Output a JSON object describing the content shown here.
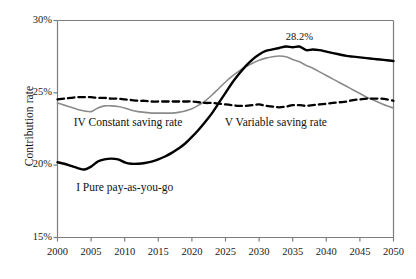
{
  "chart_data": {
    "type": "line",
    "title": "",
    "xlabel": "",
    "ylabel": "Contribution rate",
    "xlim": [
      2000,
      2050
    ],
    "ylim": [
      15,
      30
    ],
    "xticks": [
      2000,
      2005,
      2010,
      2015,
      2020,
      2025,
      2030,
      2035,
      2040,
      2045,
      2050
    ],
    "xtick_labels": [
      "2000",
      "2005",
      "2010",
      "2015",
      "2020",
      "2025",
      "2030",
      "2035",
      "2040",
      "2045",
      "2050"
    ],
    "yticks": [
      15,
      20,
      25,
      30
    ],
    "ytick_labels": [
      "15%",
      "20%",
      "25%",
      "30%"
    ],
    "grid": false,
    "legend_position": "inline-annotations",
    "annotations": [
      {
        "text": "28.2%",
        "x": 2036,
        "y": 28.2,
        "name": "peak-value-label"
      },
      {
        "text": "I Pure pay-as-you-go",
        "x": 2010,
        "y": 18.5,
        "name": "series-label-pay-as-you-go"
      },
      {
        "text": "IV Constant saving rate",
        "x": 2010.5,
        "y": 23.0,
        "name": "series-label-constant-saving"
      },
      {
        "text": "V Variable saving rate",
        "x": 2032.5,
        "y": 23.0,
        "name": "series-label-variable-saving"
      }
    ],
    "x": [
      2000,
      2001,
      2002,
      2003,
      2004,
      2005,
      2006,
      2007,
      2008,
      2009,
      2010,
      2011,
      2012,
      2013,
      2014,
      2015,
      2016,
      2017,
      2018,
      2019,
      2020,
      2021,
      2022,
      2023,
      2024,
      2025,
      2026,
      2027,
      2028,
      2029,
      2030,
      2031,
      2032,
      2033,
      2034,
      2035,
      2036,
      2037,
      2038,
      2039,
      2040,
      2041,
      2042,
      2043,
      2044,
      2045,
      2046,
      2047,
      2048,
      2049,
      2050
    ],
    "series": [
      {
        "name": "I Pure pay-as-you-go",
        "style": "solid",
        "color": "#000000",
        "width": 2.4,
        "values": [
          20.2,
          20.1,
          19.95,
          19.8,
          19.7,
          19.9,
          20.25,
          20.4,
          20.45,
          20.4,
          20.2,
          20.1,
          20.1,
          20.15,
          20.25,
          20.4,
          20.6,
          20.85,
          21.15,
          21.5,
          21.95,
          22.45,
          23.0,
          23.6,
          24.3,
          25.0,
          25.7,
          26.3,
          26.85,
          27.3,
          27.65,
          27.9,
          28.0,
          28.1,
          28.2,
          28.15,
          28.2,
          27.95,
          28.0,
          27.95,
          27.85,
          27.75,
          27.65,
          27.55,
          27.5,
          27.45,
          27.4,
          27.35,
          27.3,
          27.25,
          27.2
        ]
      },
      {
        "name": "IV Constant saving rate",
        "style": "dashed",
        "color": "#000000",
        "width": 2.3,
        "values": [
          24.55,
          24.6,
          24.65,
          24.7,
          24.7,
          24.7,
          24.65,
          24.65,
          24.6,
          24.6,
          24.55,
          24.5,
          24.45,
          24.45,
          24.4,
          24.4,
          24.4,
          24.4,
          24.4,
          24.4,
          24.4,
          24.35,
          24.3,
          24.3,
          24.25,
          24.2,
          24.15,
          24.1,
          24.1,
          24.15,
          24.2,
          24.1,
          24.05,
          24.0,
          24.05,
          24.15,
          24.15,
          24.1,
          24.15,
          24.2,
          24.25,
          24.3,
          24.35,
          24.4,
          24.5,
          24.55,
          24.6,
          24.6,
          24.6,
          24.55,
          24.45
        ]
      },
      {
        "name": "V Variable saving rate",
        "style": "solid",
        "color": "#8a8a8a",
        "width": 1.6,
        "values": [
          24.3,
          24.15,
          24.0,
          23.85,
          23.75,
          23.7,
          23.95,
          24.1,
          24.1,
          24.05,
          23.95,
          23.8,
          23.7,
          23.65,
          23.6,
          23.6,
          23.6,
          23.6,
          23.65,
          23.75,
          23.9,
          24.15,
          24.45,
          24.85,
          25.3,
          25.75,
          26.15,
          26.5,
          26.8,
          27.05,
          27.25,
          27.4,
          27.5,
          27.55,
          27.5,
          27.3,
          27.15,
          26.9,
          26.7,
          26.45,
          26.2,
          25.95,
          25.7,
          25.45,
          25.2,
          24.95,
          24.7,
          24.5,
          24.3,
          24.1,
          23.95
        ]
      }
    ]
  }
}
